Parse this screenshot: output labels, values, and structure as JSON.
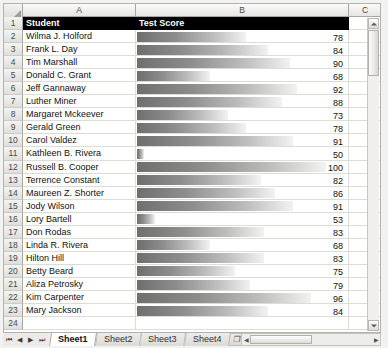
{
  "columns": {
    "headers": [
      "A",
      "B",
      "C"
    ]
  },
  "header_row": {
    "row_number": "1",
    "student_label": "Student",
    "score_label": "Test Score"
  },
  "colors": {
    "header_fill": "#000000",
    "header_text": "#ffffff",
    "bar_gradient_start": "#6f6f6f",
    "bar_gradient_end": "#f2f2f2",
    "grid_line": "#ddddd8"
  },
  "chart_data": {
    "type": "bar",
    "title": "Test Score",
    "xlabel": "",
    "ylabel": "Student",
    "categories": [
      "Wilma J. Holford",
      "Frank L. Day",
      "Tim Marshall",
      "Donald C. Grant",
      "Jeff Gannaway",
      "Luther Miner",
      "Margaret Mckeever",
      "Gerald Green",
      "Carol Valdez",
      "Kathleen B. Rivera",
      "Russell B. Cooper",
      "Terrence Constant",
      "Maureen Z. Shorter",
      "Jody Wilson",
      "Lory Bartell",
      "Don Rodas",
      "Linda R. Rivera",
      "Hilton Hill",
      "Betty Beard",
      "Aliza Petrosky",
      "Kim Carpenter",
      "Mary Jackson"
    ],
    "values": [
      78,
      84,
      90,
      68,
      92,
      88,
      73,
      78,
      91,
      50,
      100,
      82,
      86,
      91,
      53,
      83,
      68,
      83,
      75,
      79,
      96,
      84
    ],
    "ylim": [
      48,
      100
    ],
    "grid": false,
    "legend": false
  },
  "rows": [
    {
      "n": "2",
      "student": "Wilma J. Holford",
      "score": "78"
    },
    {
      "n": "3",
      "student": "Frank L. Day",
      "score": "84"
    },
    {
      "n": "4",
      "student": "Tim Marshall",
      "score": "90"
    },
    {
      "n": "5",
      "student": "Donald C. Grant",
      "score": "68"
    },
    {
      "n": "6",
      "student": "Jeff Gannaway",
      "score": "92"
    },
    {
      "n": "7",
      "student": "Luther Miner",
      "score": "88"
    },
    {
      "n": "8",
      "student": "Margaret Mckeever",
      "score": "73"
    },
    {
      "n": "9",
      "student": "Gerald Green",
      "score": "78"
    },
    {
      "n": "10",
      "student": "Carol Valdez",
      "score": "91"
    },
    {
      "n": "11",
      "student": "Kathleen B. Rivera",
      "score": "50"
    },
    {
      "n": "12",
      "student": "Russell B. Cooper",
      "score": "100"
    },
    {
      "n": "13",
      "student": "Terrence Constant",
      "score": "82"
    },
    {
      "n": "14",
      "student": "Maureen Z. Shorter",
      "score": "86"
    },
    {
      "n": "15",
      "student": "Jody Wilson",
      "score": "91"
    },
    {
      "n": "16",
      "student": "Lory Bartell",
      "score": "53"
    },
    {
      "n": "17",
      "student": "Don Rodas",
      "score": "83"
    },
    {
      "n": "18",
      "student": "Linda R. Rivera",
      "score": "68"
    },
    {
      "n": "19",
      "student": "Hilton Hill",
      "score": "83"
    },
    {
      "n": "20",
      "student": "Betty Beard",
      "score": "75"
    },
    {
      "n": "21",
      "student": "Aliza Petrosky",
      "score": "79"
    },
    {
      "n": "22",
      "student": "Kim Carpenter",
      "score": "96"
    },
    {
      "n": "23",
      "student": "Mary Jackson",
      "score": "84"
    },
    {
      "n": "24",
      "student": "",
      "score": ""
    }
  ],
  "sheet_tabs": {
    "tabs": [
      "Sheet1",
      "Sheet2",
      "Sheet3",
      "Sheet4"
    ],
    "active": "Sheet1",
    "insert_label": "❐"
  },
  "nav_buttons": [
    "⏮",
    "◀",
    "▶",
    "⏭"
  ],
  "scrollbars": {
    "up_arrow": "▲",
    "down_arrow": "▼",
    "left_arrow": "◀",
    "right_arrow": "▶"
  }
}
